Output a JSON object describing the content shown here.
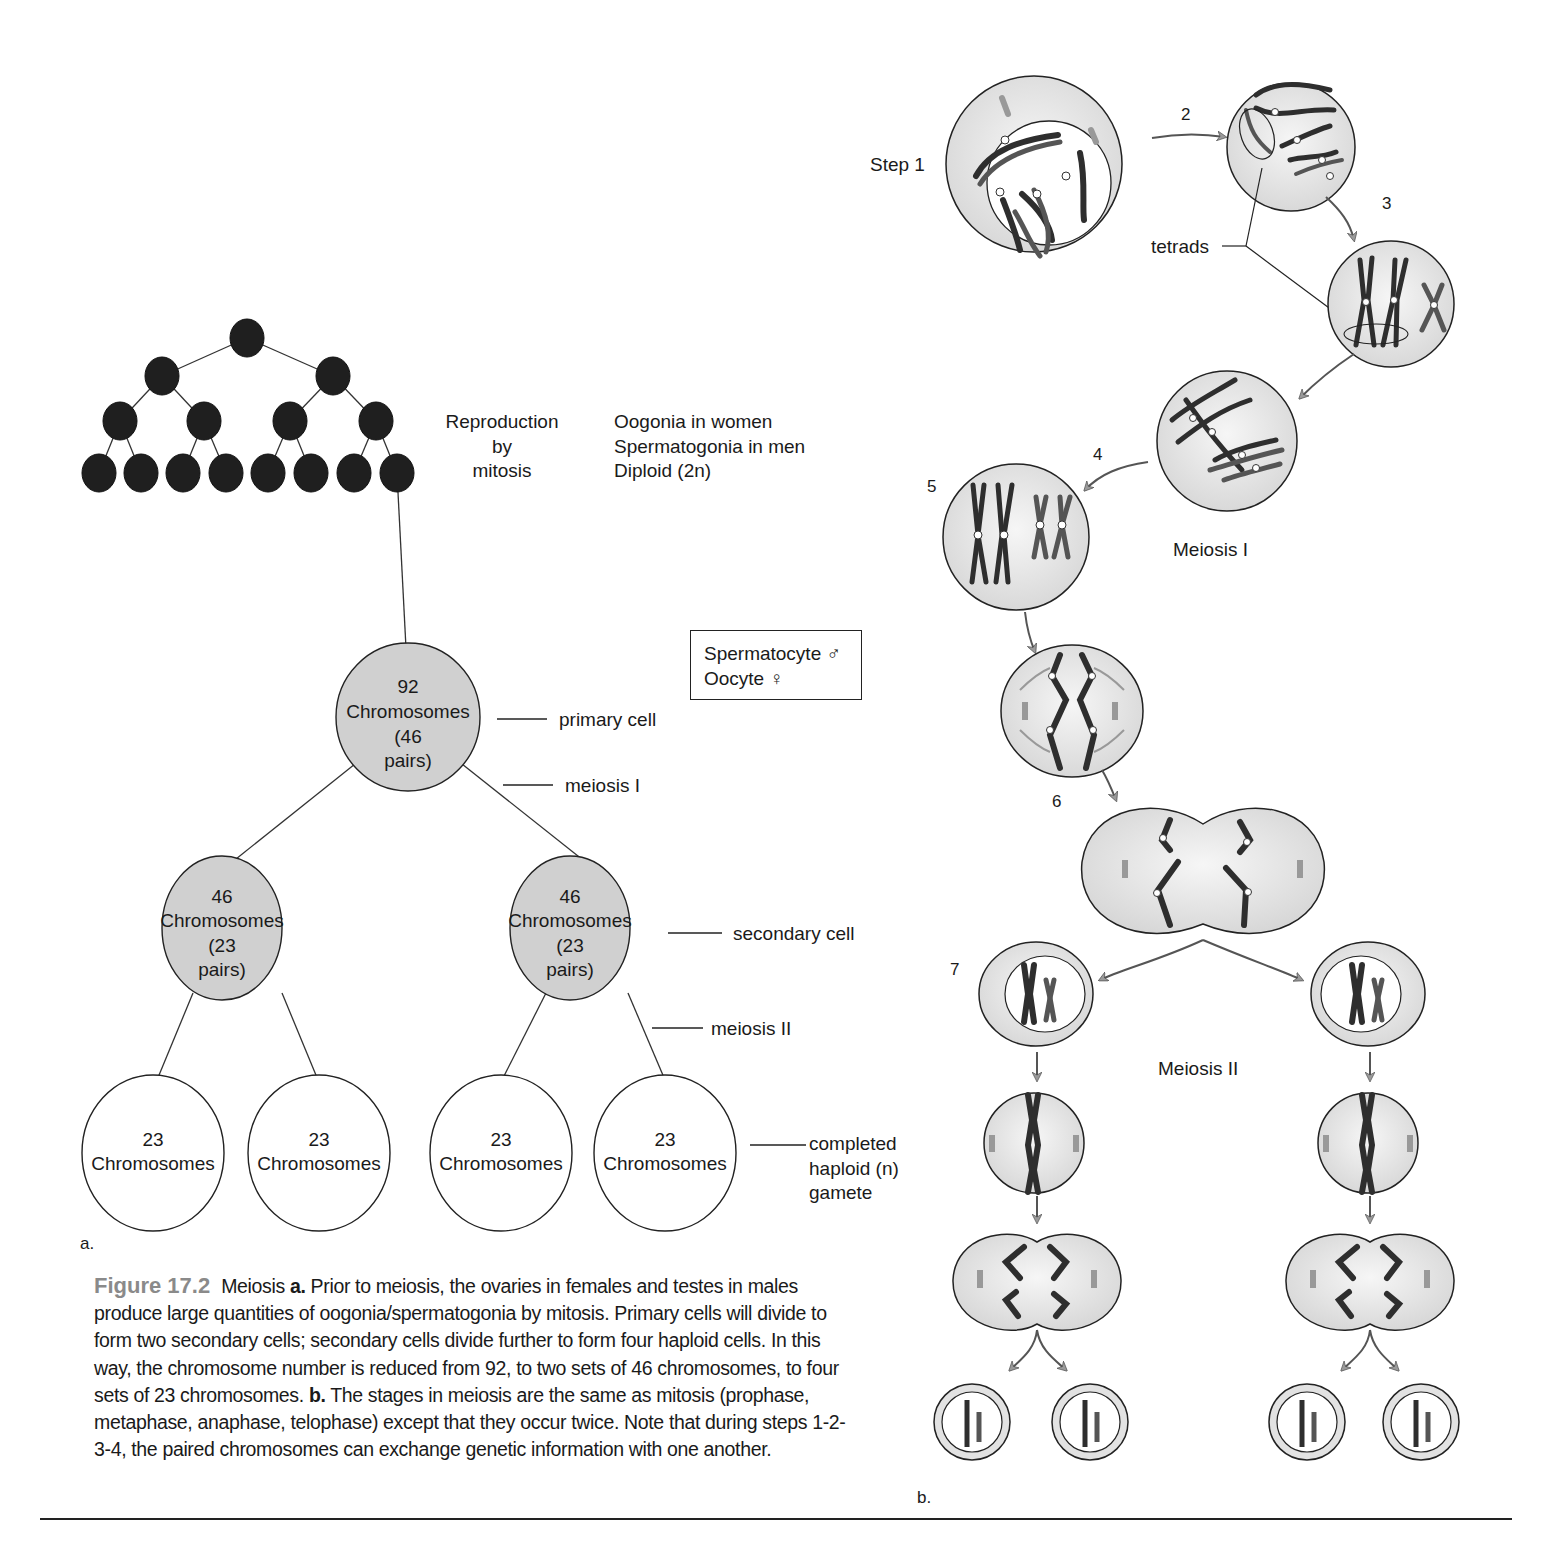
{
  "figure": {
    "number_label": "Figure 17.2",
    "caption_parts": [
      {
        "text": " Meiosis ",
        "bold": false
      },
      {
        "text": "a.",
        "bold": true
      },
      {
        "text": " Prior to meiosis, the ovaries in females and testes in males produce large quantities of oogonia/spermatogonia by mitosis. Primary cells will divide to form two secondary cells; secondary cells divide further to form  four haploid cells. In this way, the chromosome number is reduced from 92, to two sets of 46 chromosomes, to four sets of 23 chromosomes. ",
        "bold": false
      },
      {
        "text": "b.",
        "bold": true
      },
      {
        "text": " The stages in meiosis are the same as mitosis (prophase, metaphase, anaphase, telophase) except that they occur twice. Note that during steps 1-2-3-4, the paired chromosomes can exchange genetic information with one another.",
        "bold": false
      }
    ],
    "colors": {
      "figure_label": "#8a8a8a",
      "mitosis_cell_fill": "#1f1f1f",
      "diploid_cell_fill": "#d0d0d0",
      "haploid_cell_fill": "#ffffff",
      "cell_gray": "#e2e2e2",
      "chromosome_dark": "#2e2e2e",
      "chromosome_mid": "#555555",
      "arrow_fill": "#9a9a9a"
    }
  },
  "panel_a": {
    "sublabel": "a.",
    "mitosis_label": {
      "line1": "Reproduction",
      "line2": "by",
      "line3": "mitosis"
    },
    "mitosis_desc": {
      "line1": "Oogonia in women",
      "line2": "Spermatogonia in men",
      "line3": "Diploid (2n)"
    },
    "sex_box": {
      "line1": "Spermatocyte ♂",
      "line2": "Oocyte ♀"
    },
    "primary_cell": {
      "count": "92",
      "word": "Chromosomes",
      "pairs1": "(46",
      "pairs2": "pairs)"
    },
    "secondary_cells": [
      {
        "count": "46",
        "word": "Chromosomes",
        "pairs1": "(23",
        "pairs2": "pairs)"
      },
      {
        "count": "46",
        "word": "Chromosomes",
        "pairs1": "(23",
        "pairs2": "pairs)"
      }
    ],
    "gametes": [
      {
        "count": "23",
        "word": "Chromosomes"
      },
      {
        "count": "23",
        "word": "Chromosomes"
      },
      {
        "count": "23",
        "word": "Chromosomes"
      },
      {
        "count": "23",
        "word": "Chromosomes"
      }
    ],
    "callouts": {
      "primary_cell": "primary cell",
      "meiosis_1": "meiosis I",
      "secondary_cell": "secondary cell",
      "meiosis_2": "meiosis II",
      "gamete_line1": "completed",
      "gamete_line2": "haploid (n)",
      "gamete_line3": "gamete"
    }
  },
  "panel_b": {
    "sublabel": "b.",
    "step_labels": {
      "s1": "Step 1",
      "s2": "2",
      "s3": "3",
      "s4": "4",
      "s5": "5",
      "s6": "6",
      "s7": "7"
    },
    "tetrads_label": "tetrads",
    "meiosis_1_label": "Meiosis I",
    "meiosis_2_label": "Meiosis II"
  }
}
